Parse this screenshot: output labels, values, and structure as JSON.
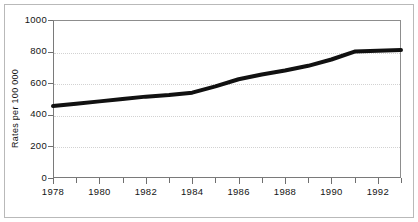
{
  "figure": {
    "background_color": "#ffffff",
    "frame_color": "#b9b9b9",
    "axis_color": "#6f6f6f",
    "grid_color": "#d2d2d2",
    "series_color": "#111111"
  },
  "chart_data": {
    "type": "line",
    "title": "",
    "xlabel": "",
    "ylabel": "Rates per 100 000",
    "xlim": [
      1978,
      1993
    ],
    "ylim": [
      0,
      1000
    ],
    "grid": true,
    "legend": "none",
    "x_tick_labels": [
      "1978",
      "1980",
      "1982",
      "1984",
      "1986",
      "1988",
      "1990",
      "1992"
    ],
    "x_tick_values": [
      1978,
      1980,
      1982,
      1984,
      1986,
      1988,
      1990,
      1992
    ],
    "x_minor_tick_values": [
      1979,
      1981,
      1983,
      1985,
      1987,
      1989,
      1991,
      1993
    ],
    "y_tick_labels": [
      "0",
      "200",
      "400",
      "600",
      "800",
      "1000"
    ],
    "y_tick_values": [
      0,
      200,
      400,
      600,
      800,
      1000
    ],
    "series": [
      {
        "name": "Rates per 100 000",
        "color": "#111111",
        "line_width": 4,
        "x": [
          1978,
          1979,
          1980,
          1981,
          1982,
          1983,
          1984,
          1985,
          1986,
          1987,
          1988,
          1989,
          1990,
          1991,
          1992,
          1993
        ],
        "values": [
          455,
          470,
          485,
          500,
          515,
          525,
          540,
          580,
          625,
          655,
          680,
          710,
          750,
          800,
          805,
          810
        ]
      }
    ]
  }
}
